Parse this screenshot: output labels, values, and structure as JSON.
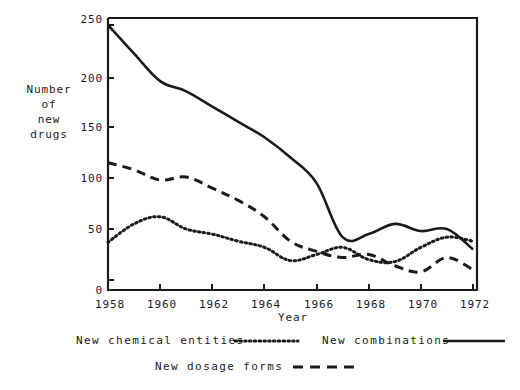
{
  "chart_data": {
    "type": "line",
    "title": "",
    "xlabel": "Year",
    "ylabel": "Number of new drugs",
    "ylabel_lines": [
      "Number",
      "of",
      "new",
      "drugs"
    ],
    "xlim": [
      1958,
      1972
    ],
    "ylim": [
      0,
      250
    ],
    "yticks": [
      0,
      50,
      100,
      150,
      200,
      250
    ],
    "ytick_labels": [
      "0",
      "50",
      "100",
      "150",
      "200",
      "250"
    ],
    "xticks": [
      1958,
      1960,
      1962,
      1964,
      1966,
      1968,
      1970,
      1972
    ],
    "xtick_labels": [
      "1958",
      "1960",
      "1962",
      "1964",
      "1966",
      "1968",
      "1970",
      "1972"
    ],
    "grid": false,
    "legend_position": "below-axes",
    "x": [
      1958,
      1959,
      1960,
      1961,
      1962,
      1963,
      1964,
      1965,
      1966,
      1967,
      1968,
      1969,
      1970,
      1971,
      1972
    ],
    "series": [
      {
        "name": "New combinations",
        "style": "solid",
        "color": "#1a1a1a",
        "values": [
          250,
          222,
          195,
          185,
          170,
          155,
          140,
          120,
          95,
          42,
          45,
          55,
          48,
          50,
          30
        ]
      },
      {
        "name": "New dosage forms",
        "style": "dashed",
        "color": "#1a1a1a",
        "values": [
          115,
          108,
          98,
          101,
          90,
          78,
          62,
          38,
          28,
          22,
          25,
          14,
          8,
          22,
          10
        ]
      },
      {
        "name": "New chemical entities",
        "style": "dotted",
        "color": "#1a1a1a",
        "values": [
          37,
          55,
          62,
          50,
          45,
          38,
          32,
          19,
          25,
          32,
          20,
          18,
          32,
          42,
          38
        ]
      }
    ]
  },
  "axis": {
    "y_title_lines": [
      "Number",
      "of",
      "new",
      "drugs"
    ],
    "x_title": "Year"
  },
  "legend": {
    "items": [
      {
        "label": "New chemical entities",
        "style": "dotted"
      },
      {
        "label": "New combinations",
        "style": "solid"
      },
      {
        "label": "New dosage forms",
        "style": "dashed"
      }
    ],
    "chemical_entities_label": "New chemical entities",
    "combinations_label": "New combinations",
    "dosage_forms_label": "New dosage forms"
  },
  "colors": {
    "ink": "#1a1a1a",
    "background": "#ffffff"
  }
}
